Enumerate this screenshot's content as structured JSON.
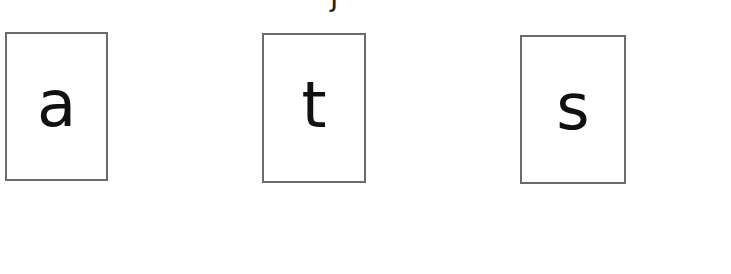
{
  "header": {
    "cropped_text": "j"
  },
  "cards": [
    {
      "letter": "a"
    },
    {
      "letter": "t"
    },
    {
      "letter": "s"
    }
  ]
}
